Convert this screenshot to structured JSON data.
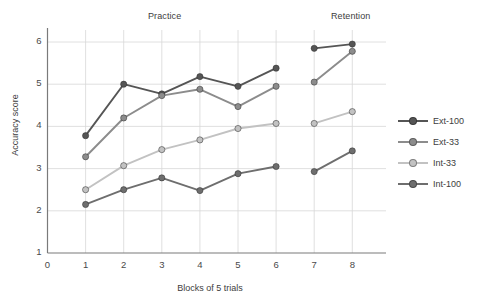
{
  "figure": {
    "panels": [
      {
        "name": "practice",
        "label": "Practice"
      },
      {
        "name": "retention",
        "label": "Retention"
      }
    ],
    "xlabel": "Blocks of 5 trials",
    "ylabel": "Accuracy score"
  },
  "axes": {
    "xticks": [
      "0",
      "1",
      "2",
      "3",
      "4",
      "5",
      "6",
      "7",
      "8"
    ],
    "yticks": [
      "1",
      "2",
      "3",
      "4",
      "5",
      "6"
    ]
  },
  "legend": {
    "items": [
      {
        "label": "Ext-100",
        "color": "#555555"
      },
      {
        "label": "Ext-33",
        "color": "#8c8c8c"
      },
      {
        "label": "Int-33",
        "color": "#c2c2c2"
      },
      {
        "label": "Int-100",
        "color": "#6e6e6e"
      }
    ]
  },
  "chart_data": {
    "type": "line",
    "title": "",
    "subtitle": "",
    "xlabel": "Blocks of 5 trials",
    "ylabel": "Accuracy score",
    "xlim": [
      0,
      8.4
    ],
    "ylim": [
      1,
      6.2
    ],
    "xticks": [
      0,
      1,
      2,
      3,
      4,
      5,
      6,
      7,
      8
    ],
    "yticks": [
      1,
      2,
      3,
      4,
      5,
      6
    ],
    "grid": "both",
    "legend_position": "right",
    "annotations": [
      {
        "text": "Practice",
        "x": 3.5,
        "y": 6.15
      },
      {
        "text": "Retention",
        "x": 7.5,
        "y": 6.15
      }
    ],
    "panels": [
      "Practice (blocks 1-6)",
      "Retention (blocks 7-8)"
    ],
    "x": [
      1,
      2,
      3,
      4,
      5,
      6,
      7,
      8
    ],
    "series": [
      {
        "name": "Ext-100",
        "color": "#555555",
        "values": [
          3.78,
          5.0,
          4.77,
          5.18,
          4.95,
          5.38,
          5.85,
          5.95
        ]
      },
      {
        "name": "Ext-33",
        "color": "#8c8c8c",
        "values": [
          3.28,
          4.2,
          4.73,
          4.88,
          4.47,
          4.95,
          5.05,
          5.78
        ]
      },
      {
        "name": "Int-33",
        "color": "#c2c2c2",
        "values": [
          2.5,
          3.07,
          3.45,
          3.68,
          3.95,
          4.07,
          4.07,
          4.35
        ]
      },
      {
        "name": "Int-100",
        "color": "#6e6e6e",
        "values": [
          2.15,
          2.5,
          2.78,
          2.48,
          2.88,
          3.05,
          2.93,
          3.42
        ]
      }
    ]
  }
}
